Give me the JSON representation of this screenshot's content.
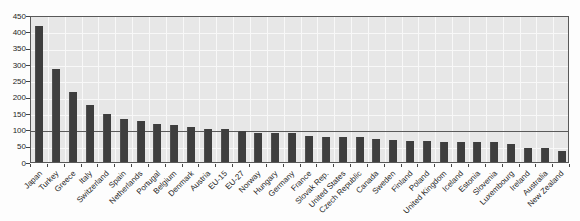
{
  "chart_data": {
    "type": "bar",
    "title": "",
    "xlabel": "",
    "ylabel": "",
    "categories": [
      "Japan",
      "Turkey",
      "Greece",
      "Italy",
      "Switzerland",
      "Spain",
      "Netherlands",
      "Portugal",
      "Belgium",
      "Denmark",
      "Austria",
      "EU-15",
      "EU-27",
      "Norway",
      "Hungary",
      "Germany",
      "France",
      "Slovak Rep.",
      "United States",
      "Czech Republic",
      "Canada",
      "Sweden",
      "Finland",
      "Poland",
      "United Kingdom",
      "Iceland",
      "Estonia",
      "Slovenia",
      "Luxembourg",
      "Ireland",
      "Australia",
      "New Zealand"
    ],
    "values": [
      418,
      284,
      214,
      176,
      146,
      133,
      125,
      115,
      112,
      106,
      102,
      100,
      95,
      90,
      89,
      88,
      80,
      78,
      77,
      76,
      70,
      68,
      65,
      63,
      62,
      62,
      61,
      60,
      56,
      43,
      42,
      34
    ],
    "ylim": [
      0,
      450
    ],
    "ytick_interval": 50,
    "yticks": [
      0,
      50,
      100,
      150,
      200,
      250,
      300,
      350,
      400,
      450
    ],
    "reference_line": 100,
    "grid": true,
    "legend": "none",
    "colors": {
      "bar": "#3e3e3e",
      "plot_background": "#e7e7e7",
      "gridline": "#f8f8f8",
      "reference_line": "#5a5a5a",
      "axis_border": "#595959",
      "tick": "#444444",
      "label_text": "#1f1f1f",
      "page_background": "#fdfdfd"
    }
  }
}
